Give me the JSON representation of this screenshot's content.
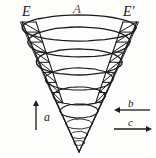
{
  "figure": {
    "title_labels": {
      "left_edge": "E",
      "right_edge": "E'",
      "apex_axis": "A"
    },
    "vectors": [
      {
        "name": "a",
        "label": "a",
        "direction": "up",
        "x": 36,
        "y1": 130,
        "y2": 100
      },
      {
        "name": "b",
        "label": "b",
        "direction": "left",
        "y": 110,
        "x1": 150,
        "x2": 114
      },
      {
        "name": "c",
        "label": "c",
        "direction": "right",
        "y": 129,
        "x1": 114,
        "x2": 152
      }
    ],
    "colors": {
      "ink": "#1b1b1b",
      "ink_light": "#3a3a3a",
      "background": "#fdfdfc"
    },
    "cone": {
      "apex_x": 79,
      "apex_y": 152,
      "top_left_x": 22,
      "top_right_x": 137,
      "top_y": 22,
      "rings": [
        {
          "cy": 28,
          "rx": 57,
          "ry": 13
        },
        {
          "cy": 42,
          "rx": 51,
          "ry": 15
        },
        {
          "cy": 62,
          "rx": 43,
          "ry": 13
        },
        {
          "cy": 79,
          "rx": 34,
          "ry": 11
        },
        {
          "cy": 96,
          "rx": 26,
          "ry": 9
        },
        {
          "cy": 111,
          "rx": 19,
          "ry": 7
        },
        {
          "cy": 124,
          "rx": 13,
          "ry": 5
        },
        {
          "cy": 135,
          "rx": 8,
          "ry": 3.5
        },
        {
          "cy": 143,
          "rx": 5,
          "ry": 2.4
        }
      ],
      "hatch_rungs_left": 8,
      "hatch_rungs_right": 8
    }
  }
}
